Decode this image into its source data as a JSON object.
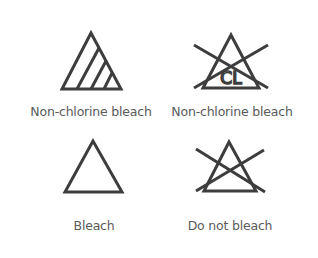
{
  "colors": {
    "background": "#ffffff",
    "icon_stroke": "#3d3d3d",
    "label_text": "#5a5a5a"
  },
  "symbols": [
    {
      "icon": "non-chlorine-bleach-icon",
      "label": "Non-chlorine bleach"
    },
    {
      "icon": "do-not-non-chlorine-bleach-icon",
      "label": "Non-chlorine bleach",
      "inner_text": "CL"
    },
    {
      "icon": "bleach-icon",
      "label": "Bleach"
    },
    {
      "icon": "do-not-bleach-icon",
      "label": "Do not bleach"
    }
  ]
}
